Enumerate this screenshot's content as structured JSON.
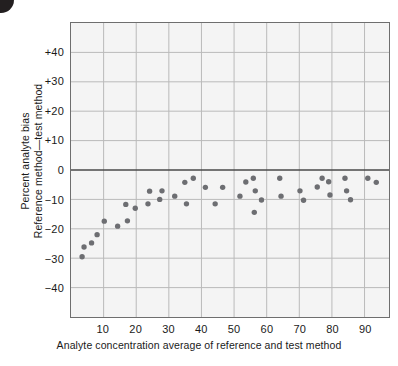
{
  "figure": {
    "corner_mark": "page-corner-dot"
  },
  "chart_data": {
    "type": "scatter",
    "title": "",
    "xlabel": "Analyte concentration average of reference and test method",
    "ylabel_line1": "Percent analyte bias",
    "ylabel_line2": "Reference method—test method",
    "xlim": [
      0,
      97.5
    ],
    "ylim": [
      -50,
      50
    ],
    "xticks": [
      10,
      20,
      30,
      40,
      50,
      60,
      70,
      80,
      90
    ],
    "xtick_labels": [
      "10",
      "20",
      "30",
      "40",
      "50",
      "60",
      "70",
      "80",
      "90"
    ],
    "yticks": [
      40,
      30,
      20,
      10,
      0,
      -10,
      -20,
      -30,
      -40
    ],
    "ytick_labels": [
      "+40",
      "+30",
      "+20",
      "+10",
      "0",
      "−10",
      "−20",
      "−30",
      "−40"
    ],
    "grid": true,
    "grid_color": "#b9b9b9",
    "zero_line": 0,
    "zero_line_color": "#4a4a4a",
    "plot_bg": "#f4f4f4",
    "frame_color": "#6e6e6e",
    "marker_color": "#6d6e72",
    "marker_size": 5,
    "legend": "none",
    "points": [
      {
        "x": 3.4,
        "y": -29.5
      },
      {
        "x": 4.0,
        "y": -26.2
      },
      {
        "x": 6.3,
        "y": -24.8
      },
      {
        "x": 8.0,
        "y": -22.0
      },
      {
        "x": 10.2,
        "y": -17.4
      },
      {
        "x": 14.3,
        "y": -19.1
      },
      {
        "x": 16.8,
        "y": -11.7
      },
      {
        "x": 17.3,
        "y": -17.3
      },
      {
        "x": 19.7,
        "y": -13.0
      },
      {
        "x": 23.6,
        "y": -11.5
      },
      {
        "x": 24.1,
        "y": -7.2
      },
      {
        "x": 27.2,
        "y": -10.0
      },
      {
        "x": 27.9,
        "y": -7.1
      },
      {
        "x": 31.8,
        "y": -8.9
      },
      {
        "x": 34.9,
        "y": -4.2
      },
      {
        "x": 35.4,
        "y": -11.5
      },
      {
        "x": 37.5,
        "y": -2.8
      },
      {
        "x": 41.2,
        "y": -5.9
      },
      {
        "x": 44.2,
        "y": -11.5
      },
      {
        "x": 46.5,
        "y": -5.9
      },
      {
        "x": 51.8,
        "y": -8.9
      },
      {
        "x": 53.6,
        "y": -4.1
      },
      {
        "x": 55.9,
        "y": -2.8
      },
      {
        "x": 56.2,
        "y": -14.4
      },
      {
        "x": 56.5,
        "y": -7.1
      },
      {
        "x": 58.4,
        "y": -10.2
      },
      {
        "x": 64.0,
        "y": -2.8
      },
      {
        "x": 64.4,
        "y": -8.9
      },
      {
        "x": 70.2,
        "y": -7.1
      },
      {
        "x": 71.3,
        "y": -10.3
      },
      {
        "x": 75.5,
        "y": -5.8
      },
      {
        "x": 77.0,
        "y": -2.8
      },
      {
        "x": 79.0,
        "y": -4.0
      },
      {
        "x": 79.4,
        "y": -8.5
      },
      {
        "x": 84.0,
        "y": -2.8
      },
      {
        "x": 84.5,
        "y": -7.1
      },
      {
        "x": 85.7,
        "y": -10.1
      },
      {
        "x": 91.0,
        "y": -2.8
      },
      {
        "x": 93.6,
        "y": -4.2
      }
    ]
  }
}
